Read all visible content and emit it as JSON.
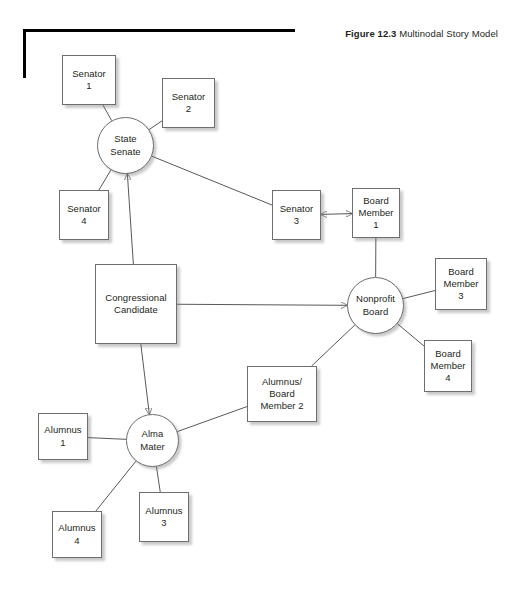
{
  "figure": {
    "number_label": "Figure 12.3",
    "title": "Multinodal Story Model"
  },
  "diagram": {
    "type": "node-link-network",
    "nodes": [
      {
        "id": "senator1",
        "label": "Senator\n1",
        "shape": "rect",
        "x": 62,
        "y": 55,
        "w": 54,
        "h": 50
      },
      {
        "id": "senator2",
        "label": "Senator\n2",
        "shape": "rect",
        "x": 162,
        "y": 78,
        "w": 53,
        "h": 50
      },
      {
        "id": "state_senate",
        "label": "State\nSenate",
        "shape": "circle",
        "x": 97,
        "y": 117,
        "w": 57,
        "h": 57
      },
      {
        "id": "senator4",
        "label": "Senator\n4",
        "shape": "rect",
        "x": 59,
        "y": 190,
        "w": 50,
        "h": 50
      },
      {
        "id": "senator3",
        "label": "Senator\n3",
        "shape": "rect",
        "x": 272,
        "y": 190,
        "w": 49,
        "h": 50
      },
      {
        "id": "board1",
        "label": "Board\nMember\n1",
        "shape": "rect",
        "x": 352,
        "y": 188,
        "w": 48,
        "h": 50
      },
      {
        "id": "cong_cand",
        "label": "Congressional\nCandidate",
        "shape": "rect",
        "x": 95,
        "y": 264,
        "w": 82,
        "h": 80
      },
      {
        "id": "nonprofit",
        "label": "Nonprofit\nBoard",
        "shape": "circle",
        "x": 347,
        "y": 277,
        "w": 57,
        "h": 57
      },
      {
        "id": "board3",
        "label": "Board\nMember\n3",
        "shape": "rect",
        "x": 435,
        "y": 258,
        "w": 52,
        "h": 52
      },
      {
        "id": "board4",
        "label": "Board\nMember\n4",
        "shape": "rect",
        "x": 424,
        "y": 340,
        "w": 48,
        "h": 52
      },
      {
        "id": "alum_board2",
        "label": "Alumnus/\nBoard\nMember 2",
        "shape": "rect",
        "x": 247,
        "y": 366,
        "w": 70,
        "h": 56
      },
      {
        "id": "alma_mater",
        "label": "Alma\nMater",
        "shape": "circle",
        "x": 126,
        "y": 414,
        "w": 53,
        "h": 53
      },
      {
        "id": "alumnus1",
        "label": "Alumnus\n1",
        "shape": "rect",
        "x": 38,
        "y": 413,
        "w": 50,
        "h": 47
      },
      {
        "id": "alumnus3",
        "label": "Alumnus\n3",
        "shape": "rect",
        "x": 139,
        "y": 492,
        "w": 50,
        "h": 50
      },
      {
        "id": "alumnus4",
        "label": "Alumnus\n4",
        "shape": "rect",
        "x": 52,
        "y": 511,
        "w": 50,
        "h": 47
      }
    ],
    "edges": [
      {
        "from": "senator1",
        "to": "state_senate",
        "arrow": "none"
      },
      {
        "from": "senator2",
        "to": "state_senate",
        "arrow": "none"
      },
      {
        "from": "senator4",
        "to": "state_senate",
        "arrow": "none"
      },
      {
        "from": "state_senate",
        "to": "senator3",
        "arrow": "none"
      },
      {
        "from": "cong_cand",
        "to": "state_senate",
        "arrow": "to"
      },
      {
        "from": "cong_cand",
        "to": "nonprofit",
        "arrow": "to"
      },
      {
        "from": "cong_cand",
        "to": "alma_mater",
        "arrow": "to"
      },
      {
        "from": "senator3",
        "to": "board1",
        "arrow": "both"
      },
      {
        "from": "board1",
        "to": "nonprofit",
        "arrow": "none"
      },
      {
        "from": "board3",
        "to": "nonprofit",
        "arrow": "none"
      },
      {
        "from": "board4",
        "to": "nonprofit",
        "arrow": "none"
      },
      {
        "from": "alum_board2",
        "to": "nonprofit",
        "arrow": "none"
      },
      {
        "from": "alum_board2",
        "to": "alma_mater",
        "arrow": "none"
      },
      {
        "from": "alumnus1",
        "to": "alma_mater",
        "arrow": "none"
      },
      {
        "from": "alumnus3",
        "to": "alma_mater",
        "arrow": "none"
      },
      {
        "from": "alumnus4",
        "to": "alma_mater",
        "arrow": "none"
      }
    ],
    "colors": {
      "node_stroke": "#6d6e71",
      "edge_stroke": "#58595b",
      "text": "#231f20",
      "rule": "#000000",
      "background": "#ffffff"
    }
  }
}
